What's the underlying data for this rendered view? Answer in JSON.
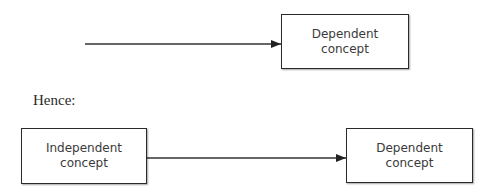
{
  "diagram": {
    "top": {
      "arrow": {
        "from": "(unlabeled)",
        "to": "dependent_top"
      },
      "dependent_box": {
        "line1": "Dependent",
        "line2": "concept"
      }
    },
    "connector_text": "Hence:",
    "bottom": {
      "independent_box": {
        "line1": "Independent",
        "line2": "concept"
      },
      "dependent_box": {
        "line1": "Dependent",
        "line2": "concept"
      },
      "arrow": {
        "from": "independent",
        "to": "dependent"
      }
    }
  }
}
